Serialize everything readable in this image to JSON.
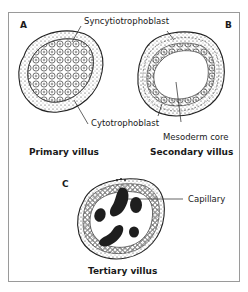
{
  "diagram": {
    "title": "",
    "panels": [
      {
        "letter": "A",
        "caption": "Primary villus"
      },
      {
        "letter": "B",
        "caption": "Secondary villus"
      },
      {
        "letter": "C",
        "caption": "Tertiary villus"
      }
    ],
    "labels": {
      "syncytiotrophoblast": "Syncytiotrophoblast",
      "cytotrophoblast": "Cytotrophoblast",
      "mesoderm_core": "Mesoderm core",
      "capillary": "Capillary"
    },
    "colors": {
      "ink": "#1e1e1e",
      "border": "#9a9a9a",
      "background": "#ffffff"
    }
  }
}
